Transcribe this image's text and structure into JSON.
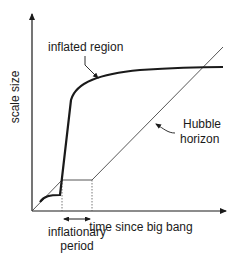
{
  "diagram": {
    "title": "",
    "axes": {
      "y_label": "scale size",
      "x_label": "time since big bang"
    },
    "labels": {
      "inflated_region": "inflated region",
      "hubble_horizon_line1": "Hubble",
      "hubble_horizon_line2": "horizon",
      "inflationary_period_line1": "inflationary",
      "inflationary_period_line2": "period"
    },
    "curves": [
      {
        "name": "inflated region",
        "style": "thick",
        "description": "scale size of an inflated region: small rise, steep exponential growth during inflation, then slow growth"
      },
      {
        "name": "Hubble horizon",
        "style": "thin",
        "description": "grows linearly, stays flat during inflationary period, then grows linearly again"
      }
    ],
    "colors": {
      "line": "#1a1a1a",
      "background": "#ffffff"
    }
  }
}
